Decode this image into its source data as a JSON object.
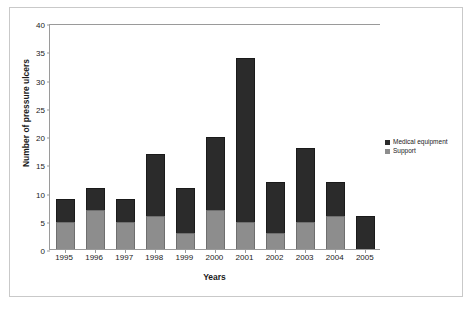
{
  "chart_data": {
    "type": "bar",
    "stacked": true,
    "title": "",
    "xlabel": "Years",
    "ylabel": "Number of pressure ulcers",
    "categories": [
      "1995",
      "1996",
      "1997",
      "1998",
      "1999",
      "2000",
      "2001",
      "2002",
      "2003",
      "2004",
      "2005"
    ],
    "series": [
      {
        "name": "Support",
        "color": "#8d8d8d",
        "values": [
          5,
          7,
          5,
          6,
          3,
          7,
          5,
          3,
          5,
          6,
          0
        ]
      },
      {
        "name": "Medical equipment",
        "color": "#2b2b2b",
        "values": [
          4,
          4,
          4,
          11,
          8,
          13,
          29,
          9,
          13,
          6,
          6
        ]
      }
    ],
    "totals": [
      9,
      11,
      9,
      17,
      11,
      20,
      34,
      12,
      18,
      12,
      6
    ],
    "ylim": [
      0,
      40
    ],
    "yticks": [
      0,
      5,
      10,
      15,
      20,
      25,
      30,
      35,
      40
    ],
    "ytick_labels": [
      "0",
      "5",
      "10",
      "15",
      "20",
      "25",
      "30",
      "35",
      "40"
    ],
    "grid": false,
    "legend_position": "right"
  },
  "legend": {
    "items": [
      {
        "label": "Medical equipment",
        "color": "#2b2b2b"
      },
      {
        "label": "Support",
        "color": "#8d8d8d"
      }
    ]
  }
}
